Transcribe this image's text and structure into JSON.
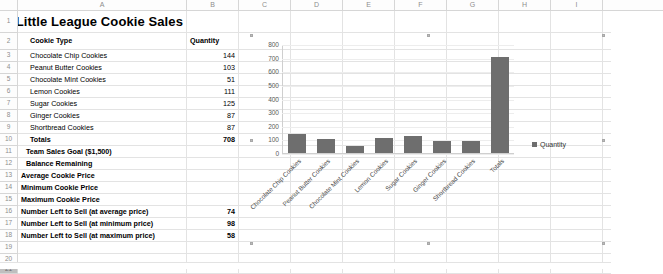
{
  "spreadsheet": {
    "columns": [
      "A",
      "B",
      "C",
      "D",
      "E",
      "F",
      "G",
      "H",
      "I"
    ],
    "row_numbers": [
      "1",
      "2",
      "3",
      "4",
      "5",
      "6",
      "7",
      "8",
      "9",
      "10",
      "11",
      "12",
      "13",
      "14",
      "15",
      "16",
      "17",
      "18",
      "19",
      "20",
      "21"
    ],
    "title": "Little League Cookie Sales",
    "headers": {
      "cookie_type": "Cookie Type",
      "quantity": "Quantity"
    },
    "rows": [
      {
        "label": "Chocolate Chip Cookies",
        "value": "144"
      },
      {
        "label": "Peanut Butter Cookies",
        "value": "103"
      },
      {
        "label": "Chocolate Mint Cookies",
        "value": "51"
      },
      {
        "label": "Lemon Cookies",
        "value": "111"
      },
      {
        "label": "Sugar Cookies",
        "value": "125"
      },
      {
        "label": "Ginger Cookies",
        "value": "87"
      },
      {
        "label": "Shortbread Cookies",
        "value": "87"
      }
    ],
    "summary": [
      {
        "label": "Totals",
        "value": "708"
      },
      {
        "label": "Team Sales Goal ($1,500)",
        "value": ""
      },
      {
        "label": "Balance Remaining",
        "value": ""
      },
      {
        "label": "Average Cookie Price",
        "value": ""
      },
      {
        "label": "Minimum Cookie Price",
        "value": ""
      },
      {
        "label": "Maximum Cookie Price",
        "value": ""
      },
      {
        "label": "Number Left to Sell (at average price)",
        "value": "74"
      },
      {
        "label": "Number Left to Sell (at minimum price)",
        "value": "98"
      },
      {
        "label": "Number Left to Sell (at maximum price)",
        "value": "58"
      }
    ]
  },
  "chart_data": {
    "type": "bar",
    "title": "",
    "xlabel": "",
    "ylabel": "",
    "categories": [
      "Chocolate Chip Cookies",
      "Peanut Butter Cookies",
      "Chocolate Mint Cookies",
      "Lemon Cookies",
      "Sugar Cookies",
      "Ginger Cookies",
      "Shortbread Cookies",
      "Totals"
    ],
    "series": [
      {
        "name": "Quantity",
        "values": [
          144,
          103,
          51,
          111,
          125,
          87,
          87,
          708
        ]
      }
    ],
    "ylim": [
      0,
      800
    ],
    "yticks": [
      "800",
      "700",
      "600",
      "500",
      "400",
      "300",
      "200",
      "100",
      "0"
    ],
    "grid": true,
    "legend_position": "right",
    "bar_color": "#6e6e6e"
  }
}
